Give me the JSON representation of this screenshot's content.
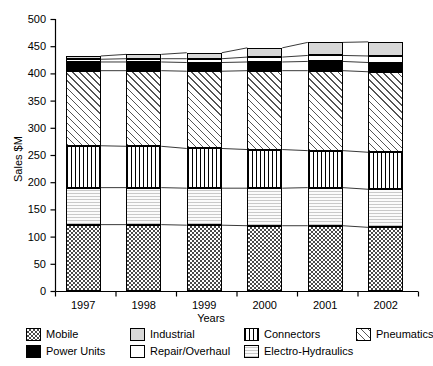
{
  "chart_data": {
    "type": "bar",
    "stacked": true,
    "title": "",
    "xlabel": "Years",
    "ylabel": "Sales $M",
    "categories": [
      "1997",
      "1998",
      "1999",
      "2000",
      "2001",
      "2002"
    ],
    "ylim": [
      0,
      500
    ],
    "yticks": [
      0,
      50,
      100,
      150,
      200,
      250,
      300,
      350,
      400,
      450,
      500
    ],
    "grid": false,
    "legend_position": "bottom",
    "series": [
      {
        "name": "Mobile",
        "pattern": "checkered",
        "values": [
          122,
          122,
          121,
          120,
          120,
          117
        ]
      },
      {
        "name": "Electro-Hydraulics",
        "pattern": "light-gray-wavy",
        "values": [
          68,
          68,
          68,
          69,
          70,
          70
        ]
      },
      {
        "name": "Connectors",
        "pattern": "vertical-lines",
        "values": [
          77,
          76,
          73,
          71,
          68,
          68
        ]
      },
      {
        "name": "Pneumatics",
        "pattern": "diagonal-hatch",
        "values": [
          138,
          139,
          142,
          145,
          147,
          148
        ]
      },
      {
        "name": "Power Units",
        "pattern": "solid-black",
        "values": [
          16,
          16,
          16,
          16,
          17,
          17
        ]
      },
      {
        "name": "Repair/Overhaul",
        "pattern": "white",
        "values": [
          5,
          6,
          7,
          9,
          11,
          12
        ]
      },
      {
        "name": "Industrial",
        "pattern": "light-gray",
        "values": [
          6,
          8,
          11,
          17,
          24,
          26
        ]
      }
    ],
    "totals": [
      432,
      435,
      438,
      447,
      457,
      458
    ]
  },
  "legend": {
    "items": [
      {
        "label": "Mobile",
        "pattern": "checkered"
      },
      {
        "label": "Power Units",
        "pattern": "solid-black"
      },
      {
        "label": "Industrial",
        "pattern": "light-gray"
      },
      {
        "label": "Repair/Overhaul",
        "pattern": "white"
      },
      {
        "label": "Connectors",
        "pattern": "vertical-lines"
      },
      {
        "label": "Electro-Hydraulics",
        "pattern": "light-gray-wavy"
      },
      {
        "label": "Pneumatics",
        "pattern": "diagonal-hatch"
      }
    ]
  },
  "axes": {
    "y_title": "Sales $M",
    "x_title": "Years",
    "y_tick_labels": [
      "0",
      "50",
      "100",
      "150",
      "200",
      "250",
      "300",
      "350",
      "400",
      "450",
      "500"
    ],
    "x_tick_labels": [
      "1997",
      "1998",
      "1999",
      "2000",
      "2001",
      "2002"
    ]
  },
  "colors": {
    "axis": "#000000",
    "plot_background": "#ffffff",
    "power_units": "#000000",
    "industrial": "#d8d8d8",
    "electro_hydraulics": "#f2f2f2"
  }
}
